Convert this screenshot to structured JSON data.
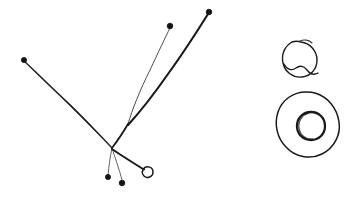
{
  "canvas": {
    "width": 352,
    "height": 205,
    "background_color": "#ffffff",
    "ink_color": "#1a1a1a",
    "ink_soft_color": "#3a3a3a",
    "title": "hand-drawn-sketch"
  },
  "drawing": {
    "description": "Freehand ink sketch: branching line structure with terminal node markers at left, two rounded blob outlines at right",
    "medium": "pen-on-paper",
    "groups": [
      {
        "name": "branching-structure",
        "junction": {
          "x": 112,
          "y": 148
        },
        "secondary_fork": {
          "x": 128,
          "y": 124
        },
        "branch_count": 5
      },
      {
        "name": "blob-shapes",
        "shape_count": 2
      }
    ]
  },
  "strokes": {
    "branch_left_main": "M 24 61 C 38 74, 52 88, 66 101 C 80 114, 96 131, 112 148",
    "branch_left_echo": "M 25 62 C 40 77, 54 90, 68 104 C 84 120, 98 134, 113 149",
    "branch_upper_thin": "M 128 124 C 132 110, 140 90, 150 70 C 158 53, 165 38, 170 28",
    "branch_upper_thick": "M 128 125 C 140 112, 154 94, 168 74 C 184 52, 198 30, 208 14",
    "branch_fork_stem": "M 128 124 C 124 131, 118 140, 112 148",
    "branch_down_a": "M 112 148 C 110 157, 109 166, 108 175",
    "branch_down_b": "M 112 148 C 115 158, 119 168, 122 180",
    "branch_right_low": "M 112 149 C 122 156, 132 162, 143 169",
    "loop_node_right": "M 143 169 C 147 165, 153 167, 153 172 C 153 177, 147 179, 144 176 C 141 173, 142 170, 145 169",
    "blob_top_outer": "M 292 42 C 285 46, 281 54, 283 63 C 285 72, 293 78, 302 77 C 311 76, 317 69, 317 60 C 317 51, 310 43, 301 42 C 298 41, 295 41, 292 42",
    "blob_top_tail": "M 284 64 C 287 70, 292 71, 296 68 C 300 65, 304 66, 307 70 C 310 74, 313 76, 318 73",
    "blob_top_cap": "M 300 41 C 304 39, 309 40, 312 43",
    "blob_big_outer": "M 306 92 C 293 92, 282 100, 278 112 C 274 124, 277 138, 286 147 C 295 157, 310 160, 322 154 C 334 148, 341 135, 339 122 C 337 108, 328 97, 315 93 C 312 92, 309 92, 306 92",
    "blob_inner": "M 311 112 C 303 112, 297 118, 297 126 C 297 134, 303 140, 311 140 C 319 140, 325 134, 325 126 C 325 118, 319 112, 311 112",
    "blob_inner_echo": "M 309 113 C 302 115, 298 121, 299 128 C 300 135, 306 140, 313 139"
  },
  "nodes": [
    {
      "name": "node-left",
      "x": 24,
      "y": 60,
      "r": 2.6,
      "style": "filled"
    },
    {
      "name": "node-top-middle",
      "x": 170,
      "y": 26,
      "r": 2.8,
      "style": "filled"
    },
    {
      "name": "node-top-right",
      "x": 209,
      "y": 12,
      "r": 2.8,
      "style": "filled"
    },
    {
      "name": "node-bottom-left",
      "x": 108,
      "y": 177,
      "r": 2.6,
      "style": "filled"
    },
    {
      "name": "node-bottom-right",
      "x": 122,
      "y": 183,
      "r": 2.8,
      "style": "filled"
    }
  ]
}
